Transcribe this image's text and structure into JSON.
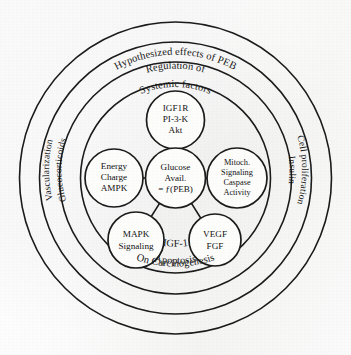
{
  "figure": {
    "background_color": "#ffffff",
    "line_color": "#1b1b1b"
  },
  "rings": [
    {
      "id": "ring-outer",
      "top_label": "Hypothesized effects of PEB",
      "bottom_label": "On Carcinogenesis",
      "left_label": "Vascularization",
      "right_label": "Cell proliferation"
    },
    {
      "id": "ring-second",
      "top_label": "Regulation of",
      "bottom_label": "Apoptosis",
      "left_label": "Glucocorticoids",
      "right_label": "Insulin"
    },
    {
      "id": "ring-third",
      "top_label": "Systemic factors",
      "bottom_label": "IGF-1",
      "left_label": "",
      "right_label": ""
    },
    {
      "id": "ring-inner",
      "top_label": "",
      "bottom_label": "",
      "left_label": "",
      "right_label": ""
    }
  ],
  "nodes": {
    "hub": {
      "name": "glucose-availability",
      "lines": [
        "Glucose",
        "Avail.",
        "= ƒ(PEB)"
      ]
    },
    "top": {
      "name": "igf1r-pi3k-akt",
      "lines": [
        "IGF1R",
        "PI-3-K",
        "Akt"
      ]
    },
    "left": {
      "name": "energy-charge-ampk",
      "lines": [
        "Energy",
        "Charge",
        "AMPK"
      ]
    },
    "right": {
      "name": "mitochondrial-signaling",
      "lines": [
        "Mitoch.",
        "Signaling",
        "Caspase",
        "Activity"
      ]
    },
    "bottom_left": {
      "name": "mapk-signaling",
      "lines": [
        "MAPK",
        "Signaling"
      ]
    },
    "bottom_right": {
      "name": "vegf-fgf",
      "lines": [
        "VEGF",
        "FGF"
      ]
    }
  }
}
